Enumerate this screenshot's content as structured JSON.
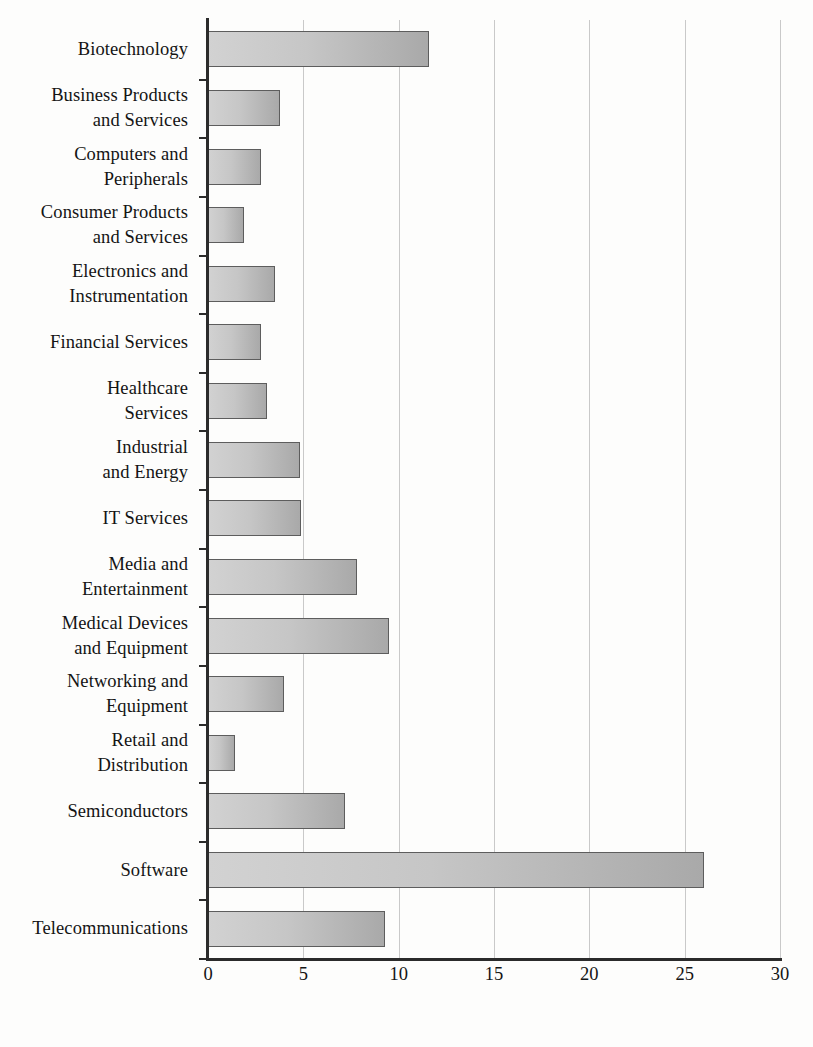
{
  "chart_data": {
    "type": "bar",
    "orientation": "horizontal",
    "title": "",
    "subtitle": "",
    "xlabel": "",
    "ylabel": "",
    "xlim": [
      0,
      30
    ],
    "xticks": [
      0,
      5,
      10,
      15,
      20,
      25,
      30
    ],
    "xtick_labels": [
      "0",
      "5",
      "10",
      "15",
      "20",
      "25",
      "30"
    ],
    "grid": "vertical",
    "legend": "none",
    "categories": [
      "Biotechnology",
      "Business Products\nand Services",
      "Computers and\nPeripherals",
      "Consumer Products\nand Services",
      "Electronics and\nInstrumentation",
      "Financial Services",
      "Healthcare\nServices",
      "Industrial\nand Energy",
      "IT Services",
      "Media and\nEntertainment",
      "Medical Devices\nand Equipment",
      "Networking and\nEquipment",
      "Retail and\nDistribution",
      "Semiconductors",
      "Software",
      "Telecommunications"
    ],
    "values": [
      11.6,
      3.8,
      2.8,
      1.9,
      3.5,
      2.8,
      3.1,
      4.8,
      4.9,
      7.8,
      9.5,
      4.0,
      1.4,
      7.2,
      26.0,
      9.3
    ],
    "colors": {
      "bar_fill_light": "#d2d2d2",
      "bar_fill_dark": "#a9a9a9",
      "bar_border": "#5d5d5d",
      "axis": "#2b2b2b",
      "gridline": "#c9c9c9",
      "background": "#fdfdfc",
      "text": "#141414"
    }
  }
}
